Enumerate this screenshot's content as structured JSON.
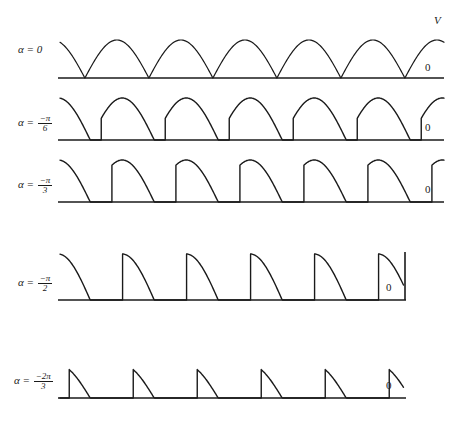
{
  "figure": {
    "width": 454,
    "height": 431,
    "background": "#ffffff",
    "stroke_color": "#1a1a1a"
  },
  "labels": {
    "voltage_axis": "V",
    "zero_level": "0",
    "alpha_symbol": "α",
    "equals": "="
  },
  "rows": [
    {
      "id": "row-alpha-0",
      "alpha_text": "α = 0",
      "alpha_value_deg": 0,
      "alpha_numerator": "",
      "alpha_denominator": "",
      "has_fraction": false,
      "baseline_label": "0",
      "v_label": "V",
      "show_v_label": true,
      "baseline_y": 78,
      "label_y": 50,
      "amplitude": 38,
      "cycles": 6,
      "cycle_width": 64,
      "wave_left": 60,
      "wave_right": 444,
      "baseline_left": 58,
      "baseline_right": 444,
      "has_right_vertical": false,
      "wave_top_gap": 22,
      "description": "full-wave rectified sine, conduction over full half cycle"
    },
    {
      "id": "row-alpha-pi-6",
      "alpha_text": "α = -π/6",
      "alpha_value_deg": -30,
      "alpha_numerator": "−π",
      "alpha_denominator": "6",
      "has_fraction": true,
      "baseline_label": "0",
      "v_label": "",
      "show_v_label": false,
      "baseline_y": 140,
      "label_y": 122,
      "amplitude": 44,
      "cycles": 6,
      "cycle_width": 64,
      "wave_left": 60,
      "wave_right": 444,
      "baseline_left": 58,
      "baseline_right": 444,
      "has_right_vertical": false,
      "wave_top_gap": 0,
      "description": "firing angle 30 degrees, sine segment from 30 to 180 degrees"
    },
    {
      "id": "row-alpha-pi-3",
      "alpha_text": "α = -π/3",
      "alpha_value_deg": -60,
      "alpha_numerator": "−π",
      "alpha_denominator": "3",
      "has_fraction": true,
      "baseline_label": "0",
      "v_label": "",
      "show_v_label": false,
      "baseline_y": 202,
      "label_y": 184,
      "amplitude": 44,
      "cycles": 6,
      "cycle_width": 64,
      "wave_left": 60,
      "wave_right": 444,
      "baseline_left": 58,
      "baseline_right": 444,
      "has_right_vertical": false,
      "wave_top_gap": 0,
      "description": "firing angle 60 degrees, sine segment from 60 to 180 degrees"
    },
    {
      "id": "row-alpha-pi-2",
      "alpha_text": "α = -π/2",
      "alpha_value_deg": -90,
      "alpha_numerator": "−π",
      "alpha_denominator": "2",
      "has_fraction": true,
      "baseline_label": "0",
      "v_label": "",
      "show_v_label": false,
      "baseline_y": 300,
      "label_y": 282,
      "amplitude": 48,
      "cycles": 6,
      "cycle_width": 64,
      "wave_left": 60,
      "wave_right": 406,
      "baseline_left": 58,
      "baseline_right": 406,
      "has_right_vertical": true,
      "wave_top_gap": 0,
      "description": "firing angle 90 degrees, sine segment from 90 to 180 degrees, peak at start"
    },
    {
      "id": "row-alpha-2pi-3",
      "alpha_text": "α = -2π/3",
      "alpha_value_deg": -120,
      "alpha_numerator": "−2π",
      "alpha_denominator": "3",
      "has_fraction": true,
      "baseline_label": "0",
      "v_label": "",
      "show_v_label": false,
      "baseline_y": 398,
      "label_y": 380,
      "amplitude": 27,
      "cycles": 6,
      "cycle_width": 64,
      "wave_left": 60,
      "wave_right": 406,
      "baseline_left": 58,
      "baseline_right": 406,
      "has_right_vertical": false,
      "wave_top_gap": 0,
      "description": "firing angle 120 degrees, short narrow conduction pulses"
    }
  ],
  "chart_data": {
    "type": "line",
    "xlabel": "",
    "ylabel": "V",
    "grid": false,
    "legend": "none",
    "series": [
      {
        "name": "α = 0",
        "firing_angle_rad": "0",
        "firing_angle_deg": 0,
        "conduction_deg": 180,
        "peak_normalized": 1.0,
        "waveform": "|sin(ωt)|"
      },
      {
        "name": "α = -π/6",
        "firing_angle_rad": "-π/6",
        "firing_angle_deg": -30,
        "conduction_deg": 150,
        "peak_normalized": 1.0,
        "waveform": "sin(ωt) for ωt in [30°,180°], else 0"
      },
      {
        "name": "α = -π/3",
        "firing_angle_rad": "-π/3",
        "firing_angle_deg": -60,
        "conduction_deg": 120,
        "peak_normalized": 1.0,
        "waveform": "sin(ωt) for ωt in [60°,180°], else 0"
      },
      {
        "name": "α = -π/2",
        "firing_angle_rad": "-π/2",
        "firing_angle_deg": -90,
        "conduction_deg": 90,
        "peak_normalized": 1.0,
        "waveform": "sin(ωt) for ωt in [90°,180°], else 0"
      },
      {
        "name": "α = -2π/3",
        "firing_angle_rad": "-2π/3",
        "firing_angle_deg": -120,
        "conduction_deg": 60,
        "peak_normalized": 0.866,
        "waveform": "sin(ωt) for ωt in [120°,180°], else 0"
      }
    ],
    "x": [
      0,
      180,
      360,
      540,
      720,
      900,
      1080
    ],
    "xlim": [
      0,
      1080
    ],
    "ylim": [
      0,
      1.05
    ],
    "annotations": [
      "V",
      "0",
      "0",
      "0",
      "0",
      "0"
    ]
  }
}
